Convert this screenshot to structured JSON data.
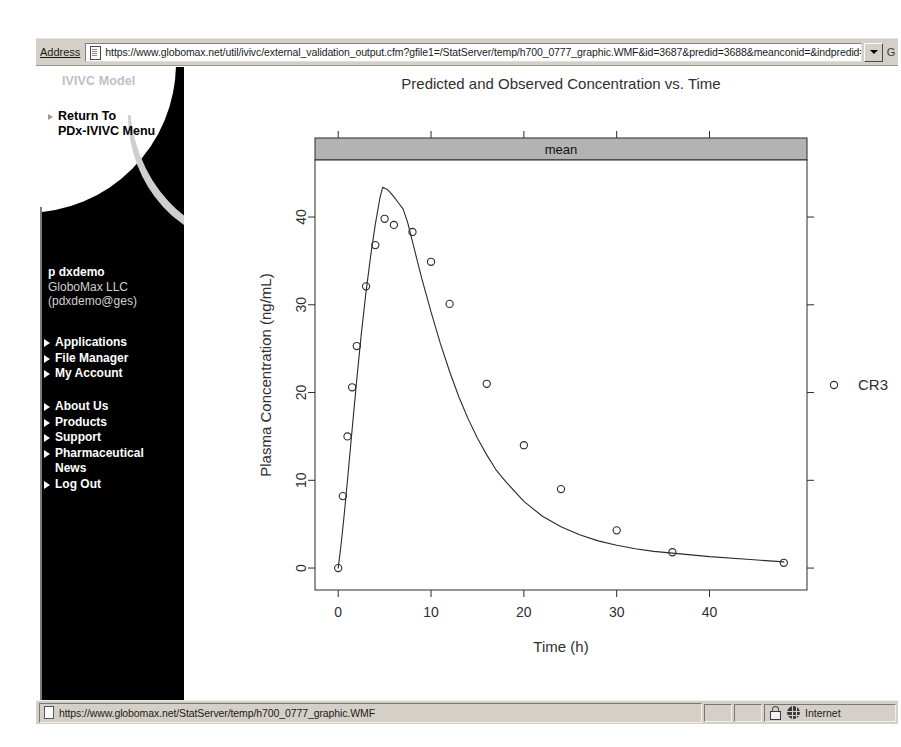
{
  "browser": {
    "address_label": "Address",
    "url": "https://www.globomax.net/util/ivivc/external_validation_output.cfm?gfile1=/StatServer/temp/h700_0777_graphic.WMF&id=3687&predid=3688&meanconid=&indpredid=",
    "go_label": "G",
    "page_icon": "page-icon",
    "dropdown_icon": "chevron-down-icon"
  },
  "sidebar": {
    "model_label": "IVIVC Model",
    "return_link": "Return To\nPDx-IVIVC Menu",
    "user": {
      "name": "p dxdemo",
      "company": "GloboMax LLC",
      "email": "(pdxdemo@ges)"
    },
    "app_items": [
      {
        "label": "Applications"
      },
      {
        "label": "File Manager"
      },
      {
        "label": "My Account"
      }
    ],
    "info_items": [
      {
        "label": "About Us",
        "bullet": true
      },
      {
        "label": "Products",
        "bullet": true
      },
      {
        "label": "Support",
        "bullet": true
      },
      {
        "label": "Pharmaceutical",
        "bullet": true
      },
      {
        "label": "News",
        "bullet": false
      },
      {
        "label": "Log Out",
        "bullet": true
      }
    ]
  },
  "statusbar": {
    "url": "https://www.globomax.net/StatServer/temp/h700_0777_graphic.WMF",
    "zone": "Internet",
    "lock_icon": "lock-icon",
    "globe_icon": "globe-icon",
    "page_icon": "page-icon"
  },
  "chart_data": {
    "type": "line",
    "title": "Predicted and Observed Concentration vs. Time",
    "strip_label": "mean",
    "xlabel": "Time (h)",
    "ylabel": "Plasma Concentration (ng/mL)",
    "xlim": [
      -2.5,
      50.5
    ],
    "ylim": [
      -2.5,
      46.5
    ],
    "xticks": [
      0,
      10,
      20,
      30,
      40
    ],
    "yticks": [
      0,
      10,
      20,
      30,
      40
    ],
    "grid": false,
    "legend": {
      "position": "right",
      "entries": [
        {
          "name": "CR3",
          "marker": "open-circle"
        }
      ]
    },
    "series": [
      {
        "name": "Predicted",
        "kind": "line",
        "x": [
          0,
          0.3,
          0.6,
          1.0,
          1.5,
          2.0,
          2.5,
          3.0,
          3.5,
          4.0,
          4.5,
          4.8,
          5.2,
          5.6,
          6.0,
          6.5,
          7.0,
          7.5,
          8.0,
          8.5,
          9.0,
          10.0,
          11.0,
          12.0,
          13.0,
          14.0,
          15.0,
          16.0,
          17.0,
          18.0,
          20.0,
          22.0,
          24.0,
          26.0,
          28.0,
          30.0,
          32.0,
          34.0,
          36.0,
          40.0,
          44.0,
          48.0
        ],
        "y": [
          0.0,
          2.6,
          5.6,
          10.0,
          15.8,
          21.5,
          26.8,
          31.5,
          35.6,
          39.2,
          42.2,
          43.4,
          43.2,
          42.8,
          42.3,
          41.6,
          40.9,
          39.3,
          37.2,
          35.1,
          33.0,
          29.2,
          25.6,
          22.4,
          19.5,
          17.0,
          14.8,
          12.9,
          11.2,
          9.9,
          7.6,
          5.9,
          4.7,
          3.8,
          3.1,
          2.6,
          2.2,
          1.9,
          1.7,
          1.3,
          1.0,
          0.7
        ]
      },
      {
        "name": "CR3",
        "kind": "points",
        "marker": "open-circle",
        "x": [
          0.0,
          0.5,
          1.0,
          1.5,
          2.0,
          3.0,
          4.0,
          5.0,
          6.0,
          8.0,
          10.0,
          12.0,
          16.0,
          20.0,
          24.0,
          30.0,
          36.0,
          48.0
        ],
        "y": [
          0.0,
          8.2,
          15.0,
          20.6,
          25.3,
          32.1,
          36.8,
          39.8,
          39.1,
          38.3,
          34.9,
          30.1,
          21.0,
          14.0,
          9.0,
          4.3,
          1.8,
          0.6
        ]
      }
    ]
  }
}
